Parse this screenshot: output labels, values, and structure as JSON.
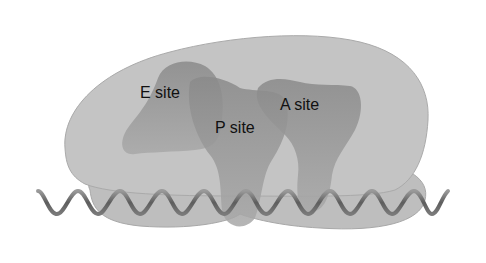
{
  "diagram": {
    "type": "ribosome",
    "labels": {
      "e_site": "E site",
      "p_site": "P site",
      "a_site": "A site"
    },
    "colors": {
      "subunit": "#bdbdbd",
      "subunit_edge": "#a4a4a4",
      "site": "#8e8e8e",
      "mrna": "#6f6f6f"
    }
  }
}
